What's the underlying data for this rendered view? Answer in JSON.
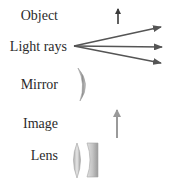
{
  "legend": {
    "items": [
      {
        "key": "object",
        "label": "Object",
        "icon": "upward-arrow-dark"
      },
      {
        "key": "light_rays",
        "label": "Light rays",
        "icon": "diverging-arrows"
      },
      {
        "key": "mirror",
        "label": "Mirror",
        "icon": "curved-mirror"
      },
      {
        "key": "image",
        "label": "Image",
        "icon": "upward-arrow-light"
      },
      {
        "key": "lens",
        "label": "Lens",
        "icon": "convex-and-concave-lens"
      }
    ]
  },
  "colors": {
    "object_arrow": "#3a3a3a",
    "ray_arrow": "#555555",
    "image_arrow": "#9a9a9a",
    "optic_gray": "#a8a8a8",
    "label_text": "#2b2b2b"
  }
}
